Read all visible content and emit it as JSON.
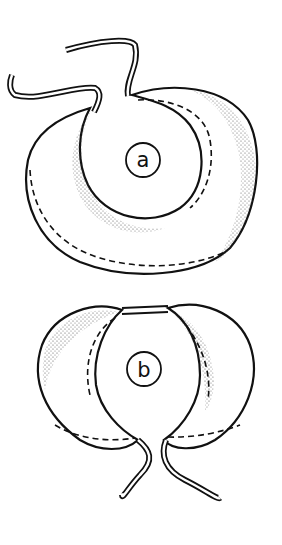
{
  "figure": {
    "panels": [
      {
        "id": "a",
        "label": "a",
        "description": "coiled crescent-shaped organ with two tubes at top"
      },
      {
        "id": "b",
        "label": "b",
        "description": "two crescent halves joined at top with tubes below"
      }
    ],
    "colors": {
      "ink": "#111111",
      "background": "#ffffff",
      "stipple": "#333333"
    }
  }
}
